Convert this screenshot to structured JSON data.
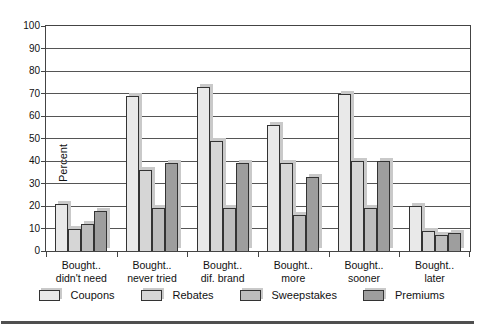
{
  "figure": {
    "background": "#ffffff",
    "divider_color": "#4f4f4f"
  },
  "chart_data": {
    "type": "bar",
    "title": "",
    "ylabel": "Percent",
    "xlabel": "",
    "ylim": [
      0,
      100
    ],
    "ytick_step": 10,
    "grid": true,
    "legend_position": "bottom-center",
    "gridline_color": "#555555",
    "bar_outline_color": "#333333",
    "bar_shadow_color": "#c9c9c9",
    "categories": [
      {
        "line1": "Bought..",
        "line2": "didn't need"
      },
      {
        "line1": "Bought..",
        "line2": "never tried"
      },
      {
        "line1": "Bought..",
        "line2": "dif. brand"
      },
      {
        "line1": "Bought..",
        "line2": "more"
      },
      {
        "line1": "Bought..",
        "line2": "sooner"
      },
      {
        "line1": "Bought..",
        "line2": "later"
      }
    ],
    "series": [
      {
        "name": "Coupons",
        "color": "#e9e9e9",
        "values": [
          21,
          69,
          73,
          56,
          70,
          20
        ]
      },
      {
        "name": "Rebates",
        "color": "#d6d6d6",
        "values": [
          10,
          36,
          49,
          39,
          40,
          9
        ]
      },
      {
        "name": "Sweepstakes",
        "color": "#bdbdbd",
        "values": [
          12,
          19,
          19,
          16,
          19,
          7
        ]
      },
      {
        "name": "Premiums",
        "color": "#9e9e9e",
        "values": [
          18,
          39,
          39,
          33,
          40,
          8
        ]
      }
    ]
  }
}
